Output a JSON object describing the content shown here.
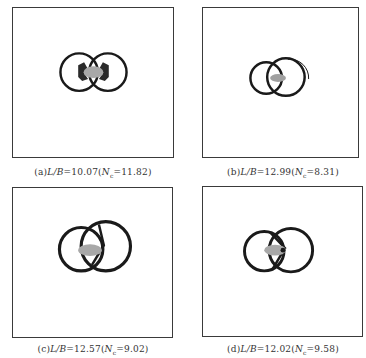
{
  "figure": {
    "panels": [
      {
        "id": "a",
        "label": "(a)",
        "ratio_label": "L/B",
        "ratio_value": "10.07",
        "n_label": "N",
        "n_sub": "c",
        "n_value": "11.82",
        "caption": "(a)L/B=10.07(Nc=11.82)"
      },
      {
        "id": "b",
        "label": "(b)",
        "ratio_label": "L/B",
        "ratio_value": "12.99",
        "n_label": "N",
        "n_sub": "c",
        "n_value": "8.31",
        "caption": "(b)L/B=12.99(Nc=8.31)"
      },
      {
        "id": "c",
        "label": "(c)",
        "ratio_label": "L/B",
        "ratio_value": "12.57",
        "n_label": "N",
        "n_sub": "c",
        "n_value": "9.02",
        "caption": "(c)L/B=12.57(Nc=9.02)"
      },
      {
        "id": "d",
        "label": "(d)",
        "ratio_label": "L/B",
        "ratio_value": "12.02",
        "n_label": "N",
        "n_sub": "c",
        "n_value": "9.58",
        "caption": "(d)L/B=12.02(Nc=9.58)"
      }
    ],
    "colors": {
      "ring": "#1a1a1a",
      "core": "#a8a8a8",
      "frame": "#3a3a3a"
    }
  }
}
